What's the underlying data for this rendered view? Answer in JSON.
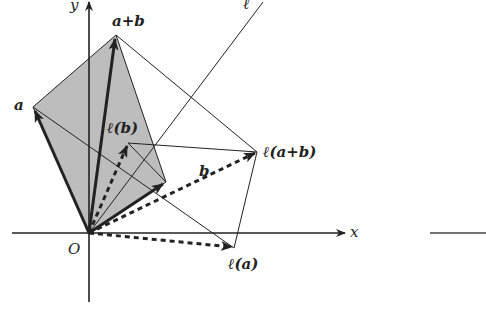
{
  "diagram": {
    "axes": {
      "x_label": "x",
      "y_label": "y",
      "origin_label": "O"
    },
    "line_label": "ℓ",
    "vectors": {
      "a": "a",
      "b": "b",
      "a_plus_b": "a+b",
      "l_a": "ℓ(a)",
      "l_b": "ℓ(b)",
      "l_a_plus_b": "ℓ(a+b)"
    },
    "colors": {
      "parallelogram_fill": "#bdbdbd",
      "stroke": "#222222"
    }
  }
}
